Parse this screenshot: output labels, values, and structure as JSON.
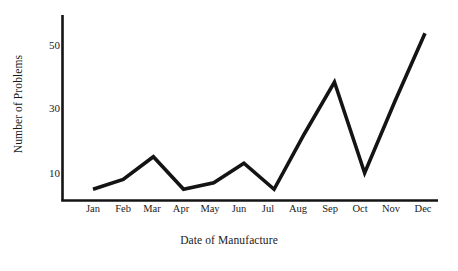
{
  "chart_data": {
    "type": "line",
    "title": "",
    "xlabel": "Date of Manufacture",
    "ylabel": "Number of Problems",
    "categories": [
      "Jan",
      "Feb",
      "Mar",
      "Apr",
      "May",
      "Jun",
      "Jul",
      "Aug",
      "Sep",
      "Oct",
      "Nov",
      "Dec"
    ],
    "values": [
      5,
      8,
      15,
      5,
      7,
      13,
      5,
      22,
      38,
      10,
      32,
      53
    ],
    "series": [
      {
        "name": "Number of Problems",
        "values": [
          5,
          8,
          15,
          5,
          7,
          13,
          5,
          22,
          38,
          10,
          32,
          53
        ]
      }
    ],
    "ytick_labels": [
      "10",
      "30",
      "50"
    ],
    "ytick_values": [
      10,
      30,
      50
    ],
    "ylim": [
      2,
      59
    ],
    "xlim": [
      0,
      13
    ],
    "grid": false,
    "legend": false,
    "line_color": "#141414",
    "line_width": 3.6,
    "axis_color": "#141414",
    "background": "#ffffff"
  }
}
